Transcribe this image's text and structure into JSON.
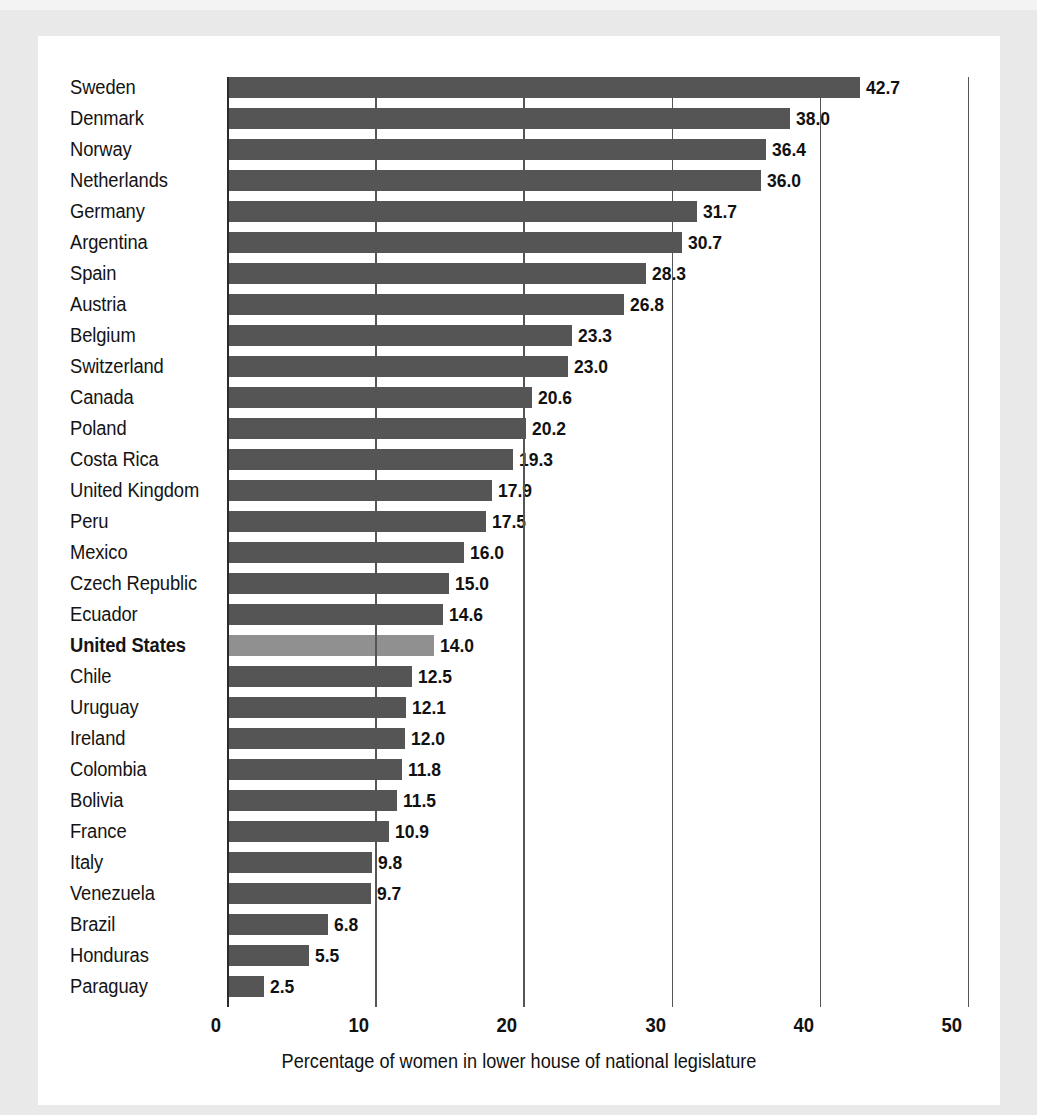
{
  "chart_data": {
    "type": "bar",
    "orientation": "horizontal",
    "title": "",
    "xlabel": "Percentage of women in lower house of national legislature",
    "ylabel": "",
    "xlim": [
      0,
      50
    ],
    "xticks": [
      0,
      10,
      20,
      30,
      40,
      50
    ],
    "xtick_labels": [
      "0",
      "10",
      "20",
      "30",
      "40",
      "50"
    ],
    "grid": true,
    "legend": "none",
    "highlight_category": "United States",
    "categories": [
      "Sweden",
      "Denmark",
      "Norway",
      "Netherlands",
      "Germany",
      "Argentina",
      "Spain",
      "Austria",
      "Belgium",
      "Switzerland",
      "Canada",
      "Poland",
      "Costa Rica",
      "United Kingdom",
      "Peru",
      "Mexico",
      "Czech Republic",
      "Ecuador",
      "United States",
      "Chile",
      "Uruguay",
      "Ireland",
      "Colombia",
      "Bolivia",
      "France",
      "Italy",
      "Venezuela",
      "Brazil",
      "Honduras",
      "Paraguay"
    ],
    "values": [
      42.7,
      38.0,
      36.4,
      36.0,
      31.7,
      30.7,
      28.3,
      26.8,
      23.3,
      23.0,
      20.6,
      20.2,
      19.3,
      17.9,
      17.5,
      16.0,
      15.0,
      14.6,
      14.0,
      12.5,
      12.1,
      12.0,
      11.8,
      11.5,
      10.9,
      9.8,
      9.7,
      6.8,
      5.5,
      2.5
    ],
    "value_labels": [
      "42.7",
      "38.0",
      "36.4",
      "36.0",
      "31.7",
      "30.7",
      "28.3",
      "26.8",
      "23.3",
      "23.0",
      "20.6",
      "20.2",
      "19.3",
      "17.9",
      "17.5",
      "16.0",
      "15.0",
      "14.6",
      "14.0",
      "12.5",
      "12.1",
      "12.0",
      "11.8",
      "11.5",
      "10.9",
      "9.8",
      "9.7",
      "6.8",
      "5.5",
      "2.5"
    ],
    "colors": {
      "bar": "#555555",
      "highlight_bar": "#909090",
      "gridline": "#2b2b2b",
      "text": "#111111",
      "card_background": "#ffffff",
      "page_background": "#e9e9e9"
    }
  }
}
